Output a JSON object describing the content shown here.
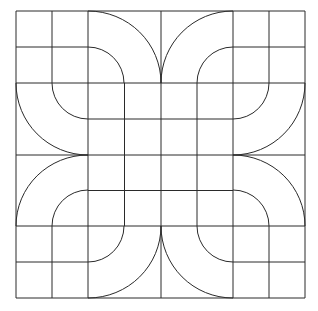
{
  "pattern": {
    "title": "",
    "stroke_color": "#2a2a2a",
    "background_color": "#ffffff",
    "grid": {
      "cols": 8,
      "rows": 8,
      "x_lines": [
        16,
        52,
        88,
        124.5,
        161,
        197,
        233,
        269,
        305
      ],
      "y_lines": [
        11,
        47,
        83,
        119,
        155,
        190.5,
        226,
        262,
        298
      ]
    },
    "quadrant_arcs": {
      "inner_radius": 36,
      "outer_radius": 72,
      "centers": [
        {
          "name": "top-left",
          "cx": 88,
          "cy": 83
        },
        {
          "name": "top-right",
          "cx": 233,
          "cy": 83
        },
        {
          "name": "bottom-left",
          "cx": 88,
          "cy": 226
        },
        {
          "name": "bottom-right",
          "cx": 233,
          "cy": 226
        }
      ]
    }
  }
}
